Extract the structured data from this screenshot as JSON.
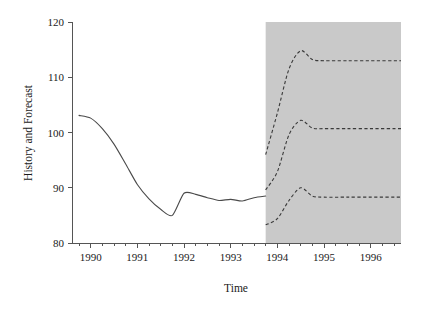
{
  "chart_data": {
    "type": "line",
    "title": "",
    "xlabel": "Time",
    "ylabel": "History and Forecast",
    "xlim": [
      1989.6,
      1996.65
    ],
    "ylim": [
      80,
      120
    ],
    "grid": false,
    "legend": null,
    "y_ticks": [
      80,
      90,
      100,
      110,
      120
    ],
    "y_tick_labels": [
      "80",
      "90",
      "100",
      "110",
      "120"
    ],
    "x_ticks": [
      1990,
      1991,
      1992,
      1993,
      1994,
      1995,
      1996
    ],
    "x_tick_labels": [
      "1990",
      "1991",
      "1992",
      "1993",
      "1994",
      "1995",
      "1996"
    ],
    "x_minor_tick_interval": 0.25,
    "annotations": [
      {
        "name": "forecast-shaded-region",
        "type": "vspan",
        "x_start": 1993.75,
        "x_end": 1996.65,
        "color": "#c9c9c9",
        "label": "forecast period shading"
      }
    ],
    "series": [
      {
        "name": "History",
        "style": "solid",
        "color": "#4a4a4a",
        "x": [
          1989.75,
          1990.0,
          1990.25,
          1990.5,
          1990.75,
          1991.0,
          1991.25,
          1991.5,
          1991.75,
          1992.0,
          1992.25,
          1992.5,
          1992.75,
          1993.0,
          1993.25,
          1993.5,
          1993.75
        ],
        "values": [
          103.1,
          102.6,
          100.7,
          97.9,
          94.3,
          90.6,
          88.0,
          86.1,
          85.0,
          89.0,
          88.8,
          88.2,
          87.7,
          87.9,
          87.6,
          88.2,
          88.5
        ]
      },
      {
        "name": "Forecast upper bound",
        "style": "dashed",
        "color": "#3a3a3a",
        "x": [
          1993.75,
          1994.0,
          1994.25,
          1994.5,
          1994.75,
          1995.0,
          1995.5,
          1996.0,
          1996.65
        ],
        "values": [
          96.0,
          103.5,
          111.5,
          114.8,
          113.2,
          113.0,
          113.0,
          113.0,
          113.0
        ]
      },
      {
        "name": "Forecast central",
        "style": "dashed",
        "color": "#3a3a3a",
        "x": [
          1993.75,
          1994.0,
          1994.25,
          1994.5,
          1994.75,
          1995.0,
          1995.5,
          1996.0,
          1996.65
        ],
        "values": [
          89.6,
          92.9,
          99.6,
          102.2,
          100.8,
          100.7,
          100.7,
          100.7,
          100.7
        ]
      },
      {
        "name": "Forecast lower bound",
        "style": "dashed",
        "color": "#3a3a3a",
        "x": [
          1993.75,
          1994.0,
          1994.25,
          1994.5,
          1994.75,
          1995.0,
          1995.5,
          1996.0,
          1996.65
        ],
        "values": [
          83.3,
          84.4,
          87.7,
          90.0,
          88.5,
          88.3,
          88.3,
          88.3,
          88.3
        ]
      }
    ]
  },
  "figure": {
    "background_color": "#ffffff",
    "axis_color": "#555555",
    "shade_color": "#c9c9c9"
  }
}
